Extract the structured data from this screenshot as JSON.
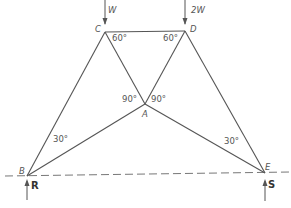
{
  "diagram": {
    "type": "truss",
    "nodes": {
      "A": {
        "label": "A"
      },
      "B": {
        "label": "B"
      },
      "C": {
        "label": "C"
      },
      "D": {
        "label": "D"
      },
      "E": {
        "label": "E"
      }
    },
    "members": [
      "B-C",
      "C-D",
      "D-E",
      "C-A",
      "D-A",
      "B-A",
      "A-E"
    ],
    "loads": [
      {
        "node": "C",
        "label": "W",
        "direction": "down"
      },
      {
        "node": "D",
        "label": "2W",
        "direction": "down"
      }
    ],
    "reactions": [
      {
        "node": "B",
        "label": "R",
        "direction": "up"
      },
      {
        "node": "E",
        "label": "S",
        "direction": "up"
      }
    ],
    "angles": {
      "C": "60°",
      "D": "60°",
      "A_left": "90°",
      "A_right": "90°",
      "B": "30°",
      "E": "30°"
    },
    "colors": {
      "line": "#555555",
      "text": "#555555"
    }
  }
}
